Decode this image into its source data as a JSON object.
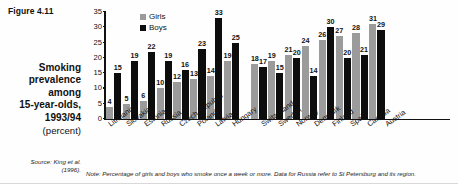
{
  "figure": {
    "label": "Figure 4.11",
    "caption_line1": "Smoking",
    "caption_line2": "prevalence",
    "caption_line3": "among",
    "caption_line4": "15-year-olds,",
    "caption_line5": "1993/94",
    "caption_units": "(percent)",
    "source_line1": "Source: King et al.",
    "source_line2": "(1996).",
    "note": "Note: Percentage of girls and boys who smoke once a week or more. Data for Russia refer to St Petersburg and its region."
  },
  "chart_data": {
    "type": "bar",
    "title": "Smoking prevalence among 15-year-olds, 1993/94 (percent)",
    "xlabel": "",
    "ylabel": "",
    "ylim": [
      0,
      35
    ],
    "yticks": [
      0,
      5,
      10,
      15,
      20,
      25,
      30,
      35
    ],
    "grid": false,
    "legend_position": "top-left",
    "categories": [
      "Lithuania",
      "Slovakia",
      "Estonia",
      "Russia",
      "Czech Republic",
      "Poland",
      "Latvia",
      "Hungary",
      "Switzerland",
      "Sweden",
      "Norway",
      "Denmark",
      "Finland",
      "Spain",
      "Canada",
      "Austria"
    ],
    "group_break_after": "Hungary",
    "series": [
      {
        "name": "Girls",
        "color": "#9b9b9b",
        "values": [
          4,
          5,
          6,
          10,
          12,
          13,
          14,
          19,
          18,
          19,
          21,
          24,
          26,
          27,
          28,
          31
        ]
      },
      {
        "name": "Boys",
        "color": "#0d0d0d",
        "values": [
          15,
          19,
          22,
          19,
          16,
          23,
          33,
          25,
          17,
          15,
          20,
          14,
          30,
          20,
          21,
          29
        ]
      }
    ]
  }
}
